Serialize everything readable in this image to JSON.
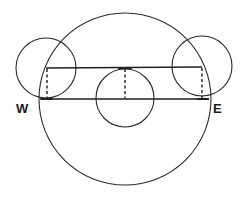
{
  "diagram": {
    "type": "geometric-circle-diagram",
    "stroke_color": "#2a2a2a",
    "background": "#ffffff",
    "labels": {
      "west": "W",
      "east": "E"
    },
    "circles": [
      {
        "name": "large-circle",
        "cx": 125,
        "cy": 99,
        "r": 86
      },
      {
        "name": "left-small-circle",
        "cx": 46,
        "cy": 68,
        "r": 30
      },
      {
        "name": "right-small-circle",
        "cx": 202,
        "cy": 66,
        "r": 30
      },
      {
        "name": "center-small-circle",
        "cx": 125,
        "cy": 98,
        "r": 29
      }
    ],
    "lines": [
      {
        "name": "upper-chord",
        "x1": 46,
        "y1": 68,
        "x2": 202,
        "y2": 67,
        "style": "solid"
      },
      {
        "name": "west-east-line",
        "x1": 40,
        "y1": 99,
        "x2": 209,
        "y2": 99,
        "style": "solid"
      },
      {
        "name": "left-dashed-vertical",
        "x1": 47,
        "y1": 68,
        "x2": 47,
        "y2": 99,
        "style": "dashed"
      },
      {
        "name": "center-dashed-vertical",
        "x1": 125,
        "y1": 68,
        "x2": 125,
        "y2": 99,
        "style": "dashed"
      },
      {
        "name": "right-dashed-vertical",
        "x1": 202,
        "y1": 67,
        "x2": 202,
        "y2": 99,
        "style": "dashed"
      }
    ]
  }
}
